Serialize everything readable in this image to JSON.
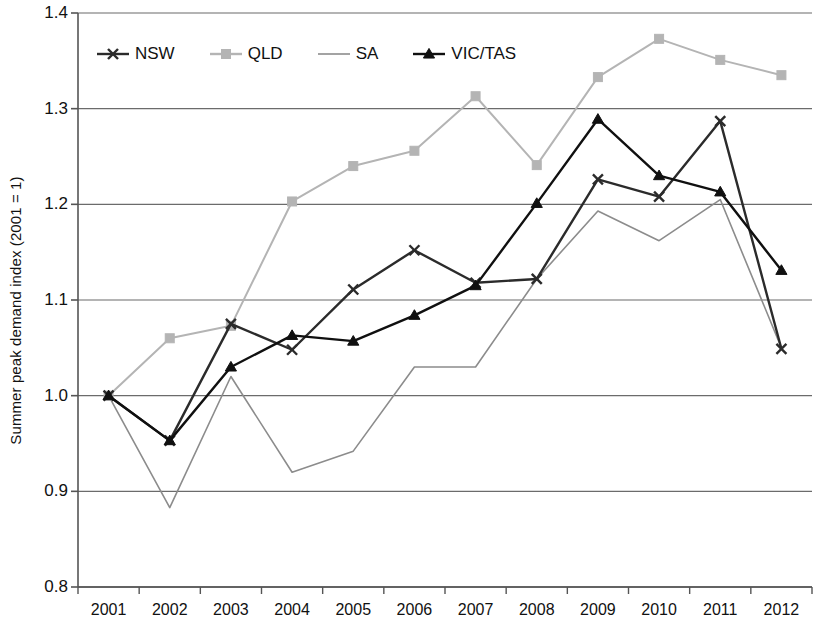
{
  "chart_data": {
    "type": "line",
    "title": "",
    "xlabel": "",
    "ylabel": "Summer peak demand index (2001 = 1)",
    "categories": [
      "2001",
      "2002",
      "2003",
      "2004",
      "2005",
      "2006",
      "2007",
      "2008",
      "2009",
      "2010",
      "2011",
      "2012"
    ],
    "x": [
      2001,
      2002,
      2003,
      2004,
      2005,
      2006,
      2007,
      2008,
      2009,
      2010,
      2011,
      2012
    ],
    "ylim": [
      0.8,
      1.4
    ],
    "yticks": [
      0.8,
      0.9,
      1.0,
      1.1,
      1.2,
      1.3,
      1.4
    ],
    "ytick_labels": [
      "0.8",
      "0.9",
      "1.0",
      "1.1",
      "1.2",
      "1.3",
      "1.4"
    ],
    "grid": "horizontal",
    "legend_position": "top-left-inside",
    "series": [
      {
        "name": "NSW",
        "color": "#2b2b2b",
        "marker": "x",
        "values": [
          1.0,
          0.953,
          1.075,
          1.048,
          1.111,
          1.152,
          1.118,
          1.122,
          1.226,
          1.208,
          1.287,
          1.049
        ]
      },
      {
        "name": "QLD",
        "color": "#b4b4b4",
        "marker": "square",
        "values": [
          1.0,
          1.06,
          1.073,
          1.203,
          1.24,
          1.256,
          1.313,
          1.241,
          1.333,
          1.373,
          1.351,
          1.335
        ]
      },
      {
        "name": "SA",
        "color": "#8c8c8c",
        "marker": "none",
        "values": [
          1.0,
          0.883,
          1.02,
          0.92,
          0.942,
          1.03,
          1.03,
          1.122,
          1.193,
          1.162,
          1.205,
          1.05
        ]
      },
      {
        "name": "VIC/TAS",
        "color": "#101010",
        "marker": "triangle",
        "values": [
          1.0,
          0.953,
          1.03,
          1.063,
          1.057,
          1.084,
          1.115,
          1.201,
          1.289,
          1.23,
          1.213,
          1.131
        ]
      }
    ]
  },
  "axes": {
    "y_axis_title": "Summer peak demand index (2001 = 1)"
  },
  "legend": {
    "items": [
      {
        "label": "NSW"
      },
      {
        "label": "QLD"
      },
      {
        "label": "SA"
      },
      {
        "label": "VIC/TAS"
      }
    ]
  },
  "colors": {
    "axis": "#555555",
    "grid": "#6b6b6b",
    "background": "#ffffff",
    "nsw": "#2b2b2b",
    "qld": "#b4b4b4",
    "sa": "#8c8c8c",
    "vic_tas": "#101010"
  }
}
